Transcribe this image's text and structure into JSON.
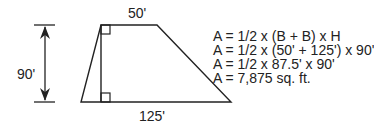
{
  "diagram": {
    "shape": "trapezoid",
    "labels": {
      "top_base": "50'",
      "bottom_base": "125'",
      "height": "90'"
    },
    "formula_lines": [
      "A = 1/2 x (B + B) x H",
      "A = 1/2 x (50' + 125') x 90'",
      "A = 1/2 x 87.5' x 90'",
      "A = 7,875 sq. ft."
    ],
    "colors": {
      "line": "#222222",
      "background": "#ffffff"
    }
  }
}
